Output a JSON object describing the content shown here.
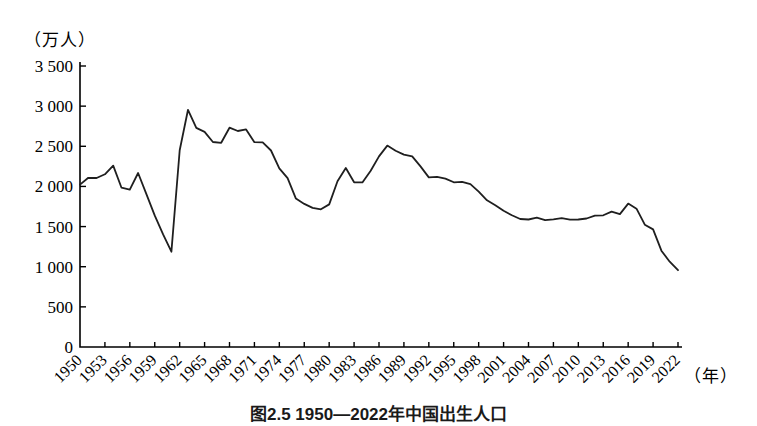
{
  "figure": {
    "caption": "图2.5 1950—2022年中国出生人口"
  },
  "chart_data": {
    "type": "line",
    "title": "图2.5 1950—2022年中国出生人口",
    "ylabel": "（万人）",
    "xlabel": "（年）",
    "x_range": [
      1950,
      2022
    ],
    "x_tick_step_years": 3,
    "ylim": [
      0,
      3500
    ],
    "grid": false,
    "legend": "none",
    "x_tick_labels": [
      "1950",
      "1953",
      "1956",
      "1959",
      "1962",
      "1965",
      "1968",
      "1971",
      "1974",
      "1977",
      "1980",
      "1983",
      "1986",
      "1989",
      "1992",
      "1995",
      "1998",
      "2001",
      "2004",
      "2007",
      "2010",
      "2013",
      "2016",
      "2019",
      "2022"
    ],
    "y_tick_values": [
      0,
      500,
      1000,
      1500,
      2000,
      2500,
      3000,
      3500
    ],
    "y_tick_labels": [
      "0",
      "500",
      "1 000",
      "1 500",
      "2 000",
      "2 500",
      "3 000",
      "3 500"
    ],
    "series": [
      {
        "name": "出生人口",
        "x_start": 1950,
        "values": [
          2023,
          2107,
          2105,
          2151,
          2260,
          1984,
          1961,
          2167,
          1905,
          1635,
          1402,
          1187,
          2451,
          2954,
          2729,
          2679,
          2554,
          2543,
          2731,
          2690,
          2710,
          2551,
          2550,
          2447,
          2226,
          2102,
          1849,
          1783,
          1733,
          1715,
          1776,
          2064,
          2230,
          2052,
          2050,
          2196,
          2374,
          2508,
          2445,
          2396,
          2374,
          2250,
          2113,
          2120,
          2098,
          2052,
          2057,
          2028,
          1934,
          1827,
          1765,
          1696,
          1641,
          1594,
          1588,
          1612,
          1581,
          1591,
          1604,
          1587,
          1588,
          1600,
          1635,
          1640,
          1687,
          1655,
          1786,
          1723,
          1523,
          1465,
          1200,
          1062,
          956
        ]
      }
    ],
    "colors": {
      "line": "#1f1f1f",
      "axis": "#000000",
      "text": "#000000",
      "background": "#ffffff"
    }
  }
}
